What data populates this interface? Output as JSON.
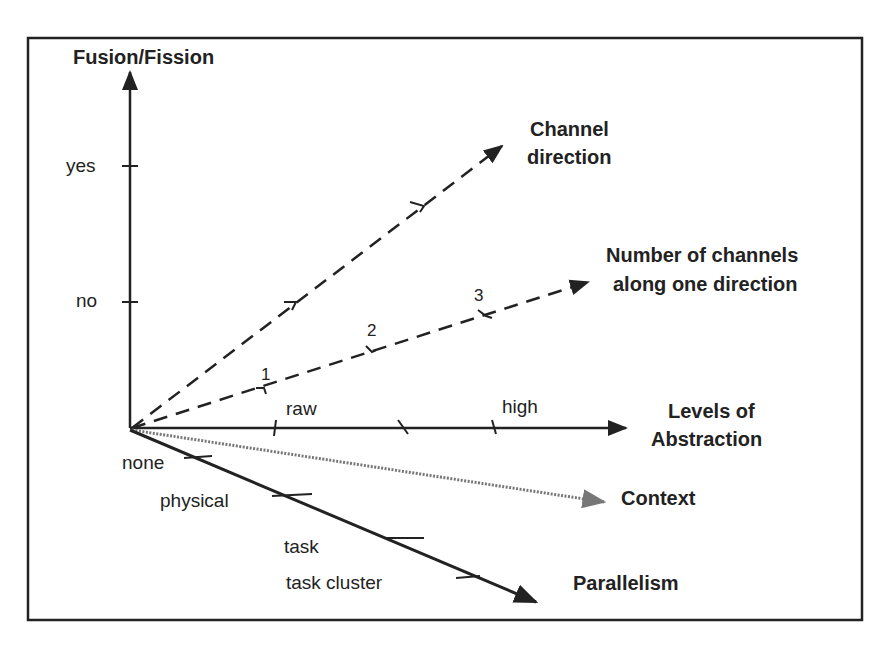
{
  "diagram": {
    "axes": {
      "fusion_fission": {
        "title": "Fusion/Fission",
        "ticks": [
          "yes",
          "no"
        ]
      },
      "channel_direction": {
        "title_line1": "Channel",
        "title_line2": "direction"
      },
      "number_of_channels": {
        "title_line1": "Number of channels",
        "title_line2": "along one direction",
        "ticks": [
          "1",
          "2",
          "3"
        ]
      },
      "levels_of_abstraction": {
        "title_line1": "Levels of",
        "title_line2": "Abstraction",
        "ticks": [
          "raw",
          "high"
        ]
      },
      "context": {
        "title": "Context"
      },
      "parallelism": {
        "title": "Parallelism",
        "ticks": [
          "none",
          "physical",
          "task",
          "task cluster"
        ]
      }
    },
    "colors": {
      "line": "#222222",
      "context_line": "#777777",
      "background": "#ffffff"
    }
  }
}
